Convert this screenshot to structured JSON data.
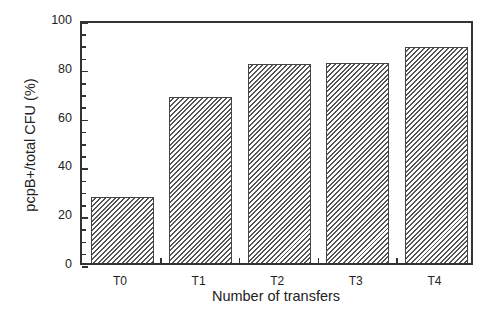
{
  "chart_data": {
    "type": "bar",
    "title": "",
    "xlabel": "Number of transfers",
    "ylabel": "pcpB+/total CFU (%)",
    "categories": [
      "T0",
      "T1",
      "T2",
      "T3",
      "T4"
    ],
    "values": [
      27,
      68,
      81.5,
      82,
      88.5
    ],
    "ylim": [
      0,
      100
    ],
    "yticks": [
      0,
      20,
      40,
      60,
      80,
      100
    ],
    "ytick_labels": [
      "0",
      "20",
      "40",
      "60",
      "80",
      "100"
    ],
    "grid": false,
    "legend": null,
    "bar_style": "diagonal hatch"
  }
}
